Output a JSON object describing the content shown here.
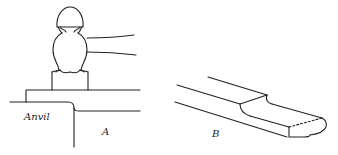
{
  "figure": {
    "panels": [
      {
        "id": "A",
        "label": "A",
        "description": "Ball-peen hammer striking stock on anvil edge"
      },
      {
        "id": "B",
        "label": "B",
        "description": "Drawn-out flattened bar end"
      }
    ],
    "anvil_label": "Anvil",
    "line_color": "#222222"
  }
}
